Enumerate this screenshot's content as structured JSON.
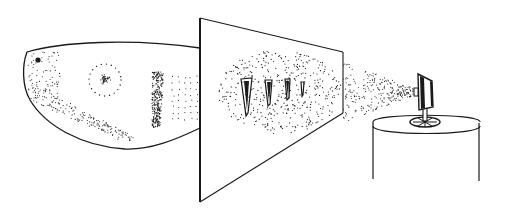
{
  "figure": {
    "type": "line-drawing",
    "background": "#ffffff",
    "ink": "#1a1a1a",
    "elements": [
      {
        "name": "fish-shape",
        "icon": "fish-silhouette"
      },
      {
        "name": "eye-dot",
        "icon": "dot"
      },
      {
        "name": "circular-spot",
        "icon": "ring-with-dot"
      },
      {
        "name": "stippled-band",
        "icon": "stipple-patch"
      },
      {
        "name": "screen-panel",
        "icon": "parallelogram"
      },
      {
        "name": "tooth-shapes",
        "count": 4,
        "icon": "tapered-spike"
      },
      {
        "name": "light-beam",
        "icon": "stipple-cone"
      },
      {
        "name": "projector-lamp",
        "icon": "lamp"
      },
      {
        "name": "pedestal-cylinder",
        "icon": "cylinder"
      }
    ]
  }
}
